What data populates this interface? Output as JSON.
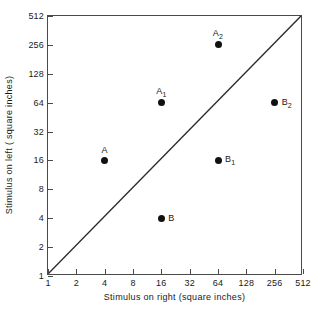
{
  "chart_data": {
    "type": "scatter",
    "title": "",
    "xlabel": "Stimulus on right  (square inches)",
    "ylabel": "Stimulus on left ( square inches)",
    "xscale": "log2",
    "yscale": "log2",
    "xlim": [
      1,
      512
    ],
    "ylim": [
      1,
      512
    ],
    "grid": false,
    "legend": "none",
    "xticks": [
      "1",
      "2",
      "4",
      "8",
      "16",
      "32",
      "64",
      "128",
      "256",
      "512"
    ],
    "yticks": [
      "1",
      "2",
      "4",
      "8",
      "16",
      "32",
      "64",
      "128",
      "256",
      "512"
    ],
    "xtick_values": [
      1,
      2,
      4,
      8,
      16,
      32,
      64,
      128,
      256,
      512
    ],
    "ytick_values": [
      1,
      2,
      4,
      8,
      16,
      32,
      64,
      128,
      256,
      512
    ],
    "annotations": [
      {
        "text": "identity line y = x, drawn corner to corner"
      }
    ],
    "points": [
      {
        "label": "A",
        "sub": "",
        "x": 4,
        "y": 16,
        "label_pos": "above"
      },
      {
        "label": "A",
        "sub": "1",
        "x": 16,
        "y": 64,
        "label_pos": "above"
      },
      {
        "label": "A",
        "sub": "2",
        "x": 64,
        "y": 256,
        "label_pos": "above"
      },
      {
        "label": "B",
        "sub": "",
        "x": 16,
        "y": 4,
        "label_pos": "right"
      },
      {
        "label": "B",
        "sub": "1",
        "x": 64,
        "y": 16,
        "label_pos": "right"
      },
      {
        "label": "B",
        "sub": "2",
        "x": 256,
        "y": 64,
        "label_pos": "right"
      }
    ],
    "marker_color": "#111111",
    "axis_color": "#4a4a4a"
  }
}
